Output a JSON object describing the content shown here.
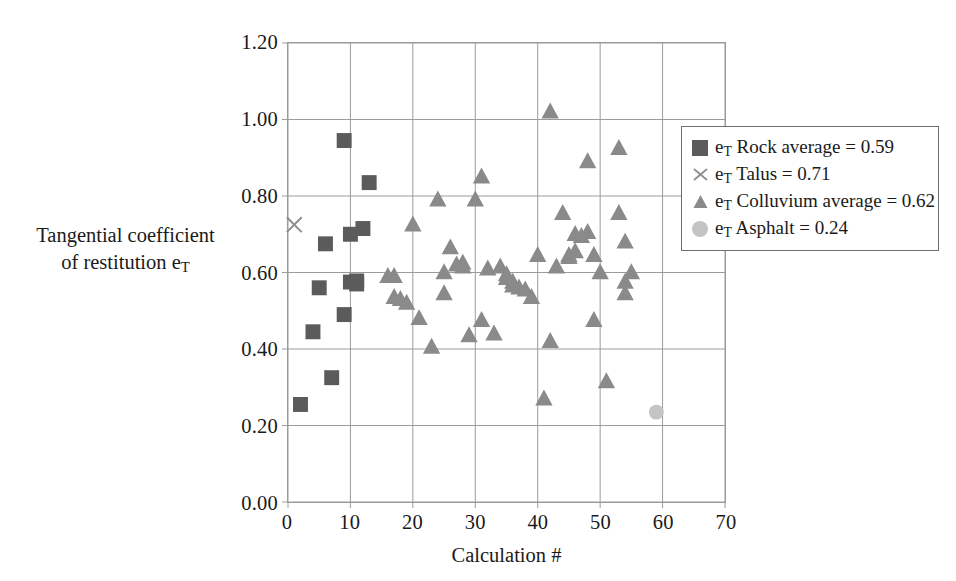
{
  "axes": {
    "y_title_line1": "Tangential coefficient",
    "y_title_line2_pre": "of restitution e",
    "y_title_line2_sub": "T",
    "x_title": "Calculation #",
    "y_ticks": [
      "0.00",
      "0.20",
      "0.40",
      "0.60",
      "0.80",
      "1.00",
      "1.20"
    ],
    "x_ticks": [
      "0",
      "10",
      "20",
      "30",
      "40",
      "50",
      "60",
      "70"
    ]
  },
  "legend": {
    "items": [
      {
        "marker": "square-marker",
        "pre": "e",
        "sub": "T",
        "post": " Rock average = 0.59"
      },
      {
        "marker": "cross-marker",
        "pre": "e",
        "sub": "T",
        "post": " Talus = 0.71"
      },
      {
        "marker": "triangle-marker",
        "pre": "e",
        "sub": "T",
        "post": " Colluvium average = 0.62"
      },
      {
        "marker": "circle-marker",
        "pre": "e",
        "sub": "T",
        "post": " Asphalt = 0.24"
      }
    ]
  },
  "colors": {
    "square": "#5b5b5b",
    "triangle": "#8a8a8a",
    "cross": "#8e8e8e",
    "circle": "#c4c4c4",
    "grid": "#9a9a9a",
    "frame": "#9a9a9a"
  },
  "chart_data": {
    "type": "scatter",
    "title": "",
    "xlabel": "Calculation #",
    "ylabel": "Tangential coefficient of restitution eT",
    "xlim": [
      0,
      70
    ],
    "ylim": [
      0.0,
      1.2
    ],
    "xticks": [
      0,
      10,
      20,
      30,
      40,
      50,
      60,
      70
    ],
    "yticks": [
      0.0,
      0.2,
      0.4,
      0.6,
      0.8,
      1.0,
      1.2
    ],
    "grid": true,
    "legend_position": "upper right (inside)",
    "series": [
      {
        "name": "eT Rock average = 0.59",
        "marker": "square",
        "color": "#5b5b5b",
        "average": 0.59,
        "points": [
          [
            2,
            0.255
          ],
          [
            4,
            0.445
          ],
          [
            5,
            0.56
          ],
          [
            6,
            0.675
          ],
          [
            7,
            0.325
          ],
          [
            9,
            0.49
          ],
          [
            9,
            0.945
          ],
          [
            10,
            0.575
          ],
          [
            10,
            0.7
          ],
          [
            11,
            0.57
          ],
          [
            11,
            0.578
          ],
          [
            12,
            0.715
          ],
          [
            13,
            0.835
          ]
        ]
      },
      {
        "name": "eT Talus = 0.71",
        "marker": "cross",
        "color": "#8e8e8e",
        "average": 0.71,
        "points": [
          [
            1,
            0.725
          ]
        ]
      },
      {
        "name": "eT Colluvium average = 0.62",
        "marker": "triangle",
        "color": "#8a8a8a",
        "average": 0.62,
        "points": [
          [
            16,
            0.59
          ],
          [
            17,
            0.59
          ],
          [
            17,
            0.535
          ],
          [
            18,
            0.53
          ],
          [
            19,
            0.52
          ],
          [
            20,
            0.725
          ],
          [
            21,
            0.48
          ],
          [
            23,
            0.405
          ],
          [
            24,
            0.79
          ],
          [
            25,
            0.6
          ],
          [
            25,
            0.545
          ],
          [
            26,
            0.665
          ],
          [
            27,
            0.62
          ],
          [
            28,
            0.625
          ],
          [
            28,
            0.615
          ],
          [
            29,
            0.435
          ],
          [
            30,
            0.79
          ],
          [
            31,
            0.85
          ],
          [
            31,
            0.475
          ],
          [
            32,
            0.61
          ],
          [
            33,
            0.44
          ],
          [
            34,
            0.615
          ],
          [
            35,
            0.595
          ],
          [
            35,
            0.585
          ],
          [
            36,
            0.575
          ],
          [
            36,
            0.565
          ],
          [
            37,
            0.56
          ],
          [
            38,
            0.555
          ],
          [
            39,
            0.535
          ],
          [
            40,
            0.645
          ],
          [
            41,
            0.27
          ],
          [
            42,
            1.02
          ],
          [
            42,
            0.42
          ],
          [
            43,
            0.615
          ],
          [
            44,
            0.755
          ],
          [
            45,
            0.645
          ],
          [
            45,
            0.64
          ],
          [
            46,
            0.7
          ],
          [
            46,
            0.655
          ],
          [
            47,
            0.695
          ],
          [
            48,
            0.89
          ],
          [
            48,
            0.705
          ],
          [
            49,
            0.475
          ],
          [
            49,
            0.645
          ],
          [
            50,
            0.6
          ],
          [
            51,
            0.315
          ],
          [
            53,
            0.925
          ],
          [
            53,
            0.755
          ],
          [
            54,
            0.545
          ],
          [
            54,
            0.575
          ],
          [
            54,
            0.68
          ],
          [
            55,
            0.6
          ]
        ]
      },
      {
        "name": "eT Asphalt = 0.24",
        "marker": "circle",
        "color": "#c4c4c4",
        "average": 0.24,
        "points": [
          [
            59,
            0.235
          ]
        ]
      }
    ]
  }
}
